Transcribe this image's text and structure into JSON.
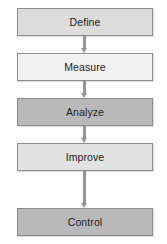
{
  "diagram": {
    "type": "process-flowchart",
    "orientation": "vertical",
    "background_color": "#fefefe",
    "steps": [
      {
        "label": "Define",
        "fill": "#dcdcdc",
        "border": "#8d8d8d"
      },
      {
        "label": "Measure",
        "fill": "#f1f1f1",
        "border": "#8d8d8d"
      },
      {
        "label": "Analyze",
        "fill": "#b9b9b9",
        "border": "#8d8d8d"
      },
      {
        "label": "Improve",
        "fill": "#e2e2e2",
        "border": "#8d8d8d"
      },
      {
        "label": "Control",
        "fill": "#b9b9b9",
        "border": "#8d8d8d"
      }
    ],
    "connectors": [
      {
        "from": "Define",
        "to": "Measure",
        "color": "#949494"
      },
      {
        "from": "Measure",
        "to": "Analyze",
        "color": "#949494"
      },
      {
        "from": "Analyze",
        "to": "Improve",
        "color": "#949494"
      },
      {
        "from": "Improve",
        "to": "Control",
        "color": "#949494"
      }
    ]
  }
}
